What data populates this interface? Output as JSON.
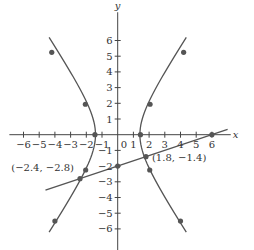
{
  "chart_data": {
    "type": "line",
    "title": "",
    "xlabel": "x",
    "ylabel": "y",
    "xlim": [
      -6.9,
      7.2
    ],
    "ylim": [
      -7.4,
      7.8
    ],
    "grid": false,
    "x_ticks": [
      -6,
      -5,
      -4,
      -3,
      -2,
      -1,
      1,
      2,
      3,
      4,
      5,
      6
    ],
    "y_ticks": [
      -6,
      -5,
      -4,
      -3,
      -2,
      -1,
      1,
      2,
      3,
      4,
      5,
      6
    ],
    "origin_label": "0",
    "series": [
      {
        "name": "hyperbola (approximate fit to drawn curve)",
        "kind": "hyperbola-horizontal",
        "a2": 2.0,
        "b2": 4.5,
        "fit_note": "Parameters estimated from dot positions; readings scatter ~15%, so this is an approximation, not the source equation.",
        "y_range": [
          -6.2,
          6.2
        ],
        "points": [
          [
            -4.2,
            5.25
          ],
          [
            -2.06,
            1.94
          ],
          [
            -1.45,
            0
          ],
          [
            -2.04,
            -2.25
          ],
          [
            -4.0,
            -5.5
          ],
          [
            4.2,
            5.25
          ],
          [
            2.06,
            1.94
          ],
          [
            1.45,
            0
          ],
          [
            2.04,
            -2.25
          ],
          [
            4.0,
            -5.5
          ]
        ],
        "color": "#555555"
      },
      {
        "name": "line",
        "kind": "line",
        "equation": "y = x/3 - 2",
        "slope": 0.3333,
        "intercept": -2,
        "x_range": [
          -4.6,
          7.0
        ],
        "points": [
          [
            0,
            -2
          ],
          [
            6,
            0
          ]
        ],
        "color": "#555555"
      }
    ],
    "annotations": [
      {
        "text": "(−2.4, −2.8)",
        "x": -2.4,
        "y": -2.8,
        "point": true
      },
      {
        "text": "(1.8, −1.4)",
        "x": 1.8,
        "y": -1.4,
        "point": true
      }
    ]
  },
  "view": {
    "origin_px": [
      117.7,
      134.7
    ],
    "unit_px": 15.7
  }
}
